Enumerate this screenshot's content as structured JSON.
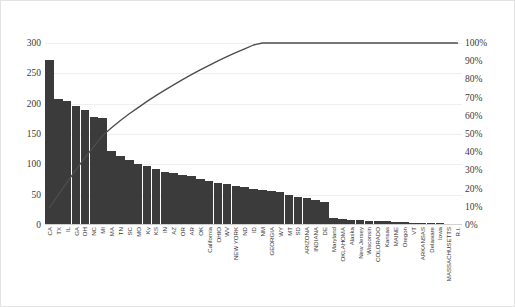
{
  "chart_data": {
    "type": "bar",
    "title": "",
    "subtitle": "",
    "xlabel": "",
    "ylabel": "",
    "y2label": "",
    "grid": true,
    "legend": "none",
    "ylim": [
      0,
      300
    ],
    "y2lim": [
      0,
      100
    ],
    "y_ticks": [
      "0",
      "50",
      "100",
      "150",
      "200",
      "250",
      "300"
    ],
    "y2_ticks": [
      "0%",
      "10%",
      "20%",
      "30%",
      "40%",
      "50%",
      "60%",
      "70%",
      "80%",
      "90%",
      "100%"
    ],
    "categories": [
      "CA",
      "TX",
      "IL",
      "GA",
      "OH",
      "NC",
      "MI",
      "MA",
      "TN",
      "SC",
      "MO",
      "Ky",
      "KS",
      "IN",
      "AZ",
      "OR",
      "AR",
      "OK",
      "California",
      "OHIO",
      "WV",
      "NEW YORK",
      "ND",
      "ID",
      "NM",
      "GEORGIA",
      "WY",
      "MT",
      "SD",
      "ARIZONA",
      "INDIANA",
      "DE",
      "Maryland",
      "OKLAHOMA",
      "Alaska",
      "New Jersey",
      "Wisconsin",
      "COLORADO",
      "Kansas",
      "MAINE",
      "Oregon",
      "VT",
      "ARKANSAS",
      "Delaware",
      "Iowa",
      "MASSACHUSETTS",
      "R.I."
    ],
    "series": [
      {
        "name": "Count",
        "type": "bar",
        "values": [
          272,
          207,
          205,
          197,
          190,
          178,
          177,
          122,
          114,
          107,
          100,
          97,
          92,
          88,
          85,
          82,
          80,
          76,
          73,
          70,
          67,
          64,
          62,
          60,
          58,
          56,
          54,
          50,
          47,
          44,
          41,
          38,
          12,
          10,
          9,
          8,
          7,
          6,
          6,
          5,
          5,
          4,
          4,
          3,
          3,
          2,
          2
        ]
      },
      {
        "name": "Cumulative %",
        "type": "line",
        "axis": "secondary",
        "values": [
          9.4,
          16.5,
          23.6,
          30.4,
          37.0,
          43.1,
          49.2,
          53.4,
          57.4,
          61.1,
          64.5,
          67.9,
          71.1,
          74.1,
          77.0,
          79.9,
          82.6,
          85.2,
          87.7,
          90.2,
          92.5,
          94.7,
          96.8,
          98.9,
          100.0,
          100.0,
          100.0,
          100.0,
          100.0,
          100.0,
          100.0,
          100.0,
          100.0,
          100.0,
          100.0,
          100.0,
          100.0,
          100.0,
          100.0,
          100.0,
          100.0,
          100.0,
          100.0,
          100.0,
          100.0,
          100.0,
          100.0
        ]
      }
    ],
    "colors": {
      "bar": "#3b3b3b",
      "line": "#4d4d4d",
      "grid": "#efefef",
      "text": "#3a3a3a",
      "frame": "#e3e3e3"
    }
  }
}
